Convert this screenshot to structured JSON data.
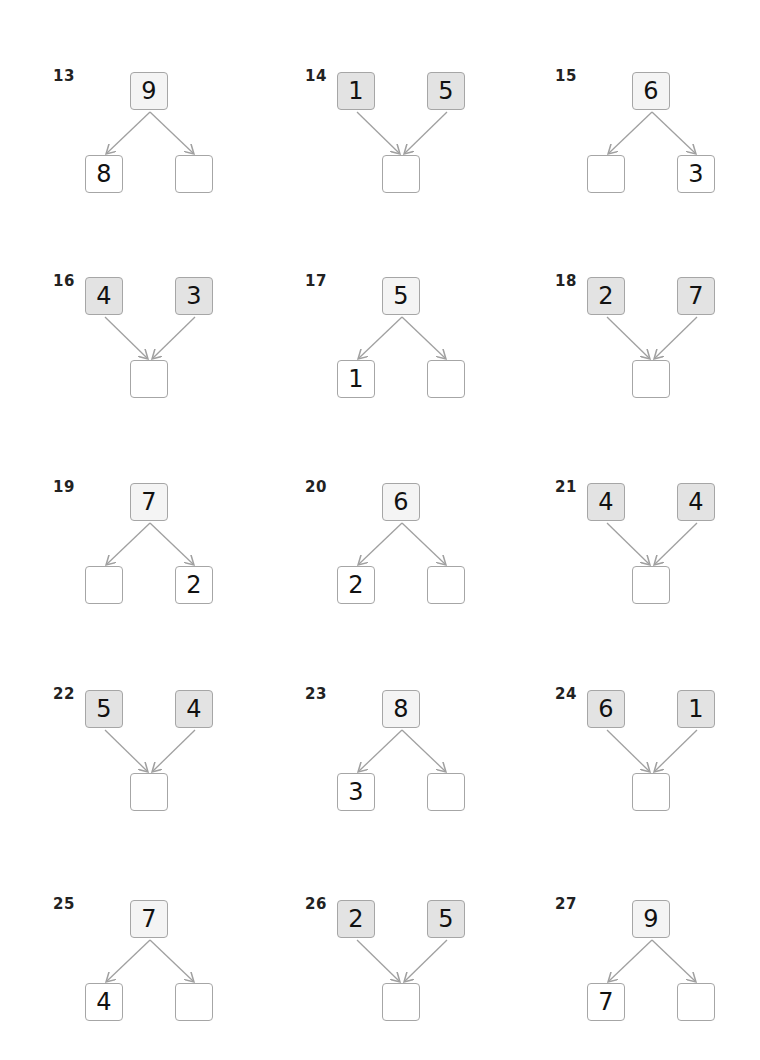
{
  "problems": [
    {
      "label": "13",
      "type": "split",
      "whole": "9",
      "left": "8",
      "right": ""
    },
    {
      "label": "14",
      "type": "join",
      "left": "1",
      "right": "5",
      "whole": ""
    },
    {
      "label": "15",
      "type": "split",
      "whole": "6",
      "left": "",
      "right": "3"
    },
    {
      "label": "16",
      "type": "join",
      "left": "4",
      "right": "3",
      "whole": ""
    },
    {
      "label": "17",
      "type": "split",
      "whole": "5",
      "left": "1",
      "right": ""
    },
    {
      "label": "18",
      "type": "join",
      "left": "2",
      "right": "7",
      "whole": ""
    },
    {
      "label": "19",
      "type": "split",
      "whole": "7",
      "left": "",
      "right": "2"
    },
    {
      "label": "20",
      "type": "split",
      "whole": "6",
      "left": "2",
      "right": ""
    },
    {
      "label": "21",
      "type": "join",
      "left": "4",
      "right": "4",
      "whole": ""
    },
    {
      "label": "22",
      "type": "join",
      "left": "5",
      "right": "4",
      "whole": ""
    },
    {
      "label": "23",
      "type": "split",
      "whole": "8",
      "left": "3",
      "right": ""
    },
    {
      "label": "24",
      "type": "join",
      "left": "6",
      "right": "1",
      "whole": ""
    },
    {
      "label": "25",
      "type": "split",
      "whole": "7",
      "left": "4",
      "right": ""
    },
    {
      "label": "26",
      "type": "join",
      "left": "2",
      "right": "5",
      "whole": ""
    },
    {
      "label": "27",
      "type": "split",
      "whole": "9",
      "left": "7",
      "right": ""
    }
  ],
  "colors": {
    "box_border": "#a6a6a6",
    "shaded_fill": "#e3e3e3",
    "top_fill": "#f4f4f4",
    "arrow": "#a0a0a0"
  }
}
